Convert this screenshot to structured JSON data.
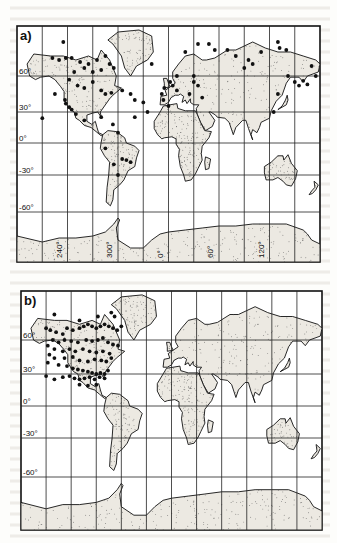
{
  "figure": {
    "panels": [
      {
        "id": "a",
        "label": "a)",
        "lat_ticks": [
          {
            "value": 60,
            "label": "60°"
          },
          {
            "value": 30,
            "label": "30°"
          },
          {
            "value": 0,
            "label": "0°"
          },
          {
            "value": -30,
            "label": "-30°"
          },
          {
            "value": -60,
            "label": "-60°"
          }
        ],
        "lon_ticks": [
          {
            "value": -120,
            "label": "240°"
          },
          {
            "value": -60,
            "label": "300°"
          },
          {
            "value": 0,
            "label": "0°"
          },
          {
            "value": 60,
            "label": "60°"
          },
          {
            "value": 120,
            "label": "120°"
          }
        ],
        "stations": [
          [
            -125,
            77
          ],
          [
            -138,
            69
          ],
          [
            -130,
            68
          ],
          [
            -122,
            69
          ],
          [
            -115,
            69
          ],
          [
            -105,
            67
          ],
          [
            -95,
            66
          ],
          [
            -85,
            68
          ],
          [
            -75,
            70
          ],
          [
            -70,
            66
          ],
          [
            -65,
            64
          ],
          [
            -80,
            63
          ],
          [
            -90,
            62
          ],
          [
            -100,
            64
          ],
          [
            -112,
            62
          ],
          [
            -118,
            57
          ],
          [
            -108,
            52
          ],
          [
            -100,
            50
          ],
          [
            -90,
            55
          ],
          [
            -80,
            48
          ],
          [
            -75,
            45
          ],
          [
            -68,
            46
          ],
          [
            -55,
            48
          ],
          [
            -45,
            45
          ],
          [
            -40,
            40
          ],
          [
            -30,
            38
          ],
          [
            -25,
            30
          ],
          [
            -150,
            24
          ],
          [
            -135,
            45
          ],
          [
            -123,
            40
          ],
          [
            -122,
            37
          ],
          [
            -118,
            34
          ],
          [
            -115,
            32
          ],
          [
            -110,
            28
          ],
          [
            -100,
            22
          ],
          [
            -80,
            25
          ],
          [
            -66,
            18
          ],
          [
            -40,
            25
          ],
          [
            -60,
            10
          ],
          [
            -75,
            -5
          ],
          [
            -65,
            -20
          ],
          [
            -55,
            -15
          ],
          [
            -50,
            -16
          ],
          [
            -45,
            -18
          ],
          [
            -60,
            -30
          ],
          [
            -20,
            66
          ],
          [
            -5,
            50
          ],
          [
            -8,
            45
          ],
          [
            2,
            55
          ],
          [
            5,
            52
          ],
          [
            10,
            48
          ],
          [
            -6,
            40
          ],
          [
            0,
            35
          ],
          [
            10,
            60
          ],
          [
            30,
            55
          ],
          [
            35,
            52
          ],
          [
            30,
            60
          ],
          [
            25,
            45
          ],
          [
            40,
            42
          ],
          [
            20,
            72
          ],
          [
            35,
            76
          ],
          [
            48,
            76
          ],
          [
            55,
            73
          ],
          [
            70,
            73
          ],
          [
            80,
            70
          ],
          [
            95,
            68
          ],
          [
            110,
            72
          ],
          [
            130,
            77
          ],
          [
            132,
            74
          ],
          [
            140,
            73
          ],
          [
            142,
            60
          ],
          [
            150,
            55
          ],
          [
            155,
            52
          ],
          [
            160,
            56
          ],
          [
            165,
            53
          ],
          [
            175,
            60
          ],
          [
            170,
            65
          ],
          [
            130,
            45
          ],
          [
            125,
            30
          ],
          [
            90,
            64
          ],
          [
            100,
            66
          ]
        ]
      },
      {
        "id": "b",
        "label": "b)",
        "lat_ticks": [
          {
            "value": 60,
            "label": "60°"
          },
          {
            "value": 30,
            "label": "30°"
          },
          {
            "value": 0,
            "label": "0°"
          },
          {
            "value": -30,
            "label": "-30°"
          },
          {
            "value": -60,
            "label": "-60°"
          }
        ],
        "lon_ticks": [],
        "stations": [
          [
            -140,
            73
          ],
          [
            -150,
            66
          ],
          [
            -145,
            65
          ],
          [
            -138,
            64
          ],
          [
            -130,
            63
          ],
          [
            -125,
            66
          ],
          [
            -118,
            65
          ],
          [
            -110,
            66
          ],
          [
            -105,
            67
          ],
          [
            -100,
            68
          ],
          [
            -95,
            67
          ],
          [
            -90,
            66
          ],
          [
            -85,
            67
          ],
          [
            -80,
            68
          ],
          [
            -75,
            67
          ],
          [
            -70,
            66
          ],
          [
            -65,
            65
          ],
          [
            -60,
            67
          ],
          [
            -110,
            70
          ],
          [
            -88,
            72
          ],
          [
            -72,
            74
          ],
          [
            -68,
            72
          ],
          [
            -142,
            60
          ],
          [
            -135,
            58
          ],
          [
            -128,
            60
          ],
          [
            -120,
            59
          ],
          [
            -112,
            58
          ],
          [
            -102,
            60
          ],
          [
            -95,
            59
          ],
          [
            -88,
            60
          ],
          [
            -82,
            61
          ],
          [
            -76,
            58
          ],
          [
            -70,
            56
          ],
          [
            -64,
            55
          ],
          [
            -148,
            55
          ],
          [
            -140,
            52
          ],
          [
            -130,
            50
          ],
          [
            -122,
            52
          ],
          [
            -115,
            50
          ],
          [
            -106,
            52
          ],
          [
            -98,
            50
          ],
          [
            -90,
            49
          ],
          [
            -82,
            50
          ],
          [
            -74,
            48
          ],
          [
            -146,
            47
          ],
          [
            -140,
            44
          ],
          [
            -128,
            44
          ],
          [
            -118,
            45
          ],
          [
            -110,
            42
          ],
          [
            -100,
            41
          ],
          [
            -92,
            43
          ],
          [
            -84,
            42
          ],
          [
            -78,
            41
          ],
          [
            -72,
            44
          ],
          [
            -148,
            40
          ],
          [
            -135,
            38
          ],
          [
            -125,
            37
          ],
          [
            -118,
            35
          ],
          [
            -112,
            34
          ],
          [
            -106,
            33
          ],
          [
            -100,
            32
          ],
          [
            -95,
            31
          ],
          [
            -90,
            30
          ],
          [
            -85,
            31
          ],
          [
            -80,
            30
          ],
          [
            -76,
            33
          ],
          [
            -150,
            28
          ],
          [
            -140,
            25
          ],
          [
            -130,
            27
          ],
          [
            -122,
            28
          ],
          [
            -116,
            26
          ],
          [
            -110,
            25
          ],
          [
            -104,
            26
          ],
          [
            -98,
            27
          ],
          [
            -92,
            25
          ],
          [
            -86,
            27
          ],
          [
            -80,
            26
          ],
          [
            -110,
            20
          ],
          [
            -100,
            19
          ],
          [
            -90,
            20
          ]
        ]
      }
    ]
  },
  "colors": {
    "ink": "#111111",
    "paper": "#fdfdfb",
    "land_fill": "#ece9e2"
  }
}
